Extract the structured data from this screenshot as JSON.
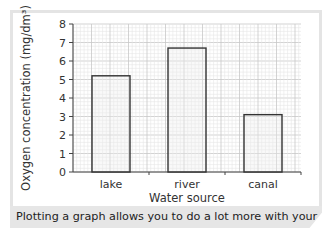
{
  "chart_data": {
    "type": "bar",
    "title": "",
    "categories": [
      "lake",
      "river",
      "canal"
    ],
    "values": [
      5.2,
      6.7,
      3.1
    ],
    "xlabel": "Water source",
    "ylabel": "Oxygen concentration (mg/dm³)",
    "ylim": [
      0,
      8
    ],
    "yticks": [
      0,
      1,
      2,
      3,
      4,
      5,
      6,
      7,
      8
    ],
    "grid": true,
    "legend": null
  },
  "caption": "Plotting a graph allows you to do a lot more with your data.",
  "colors": {
    "grid_major": "#c8c8c8",
    "grid_minor": "#e6e6e6",
    "bar_fill": "#efefef",
    "bar_stroke": "#333333",
    "caption_bg": "#e6e6e6"
  }
}
